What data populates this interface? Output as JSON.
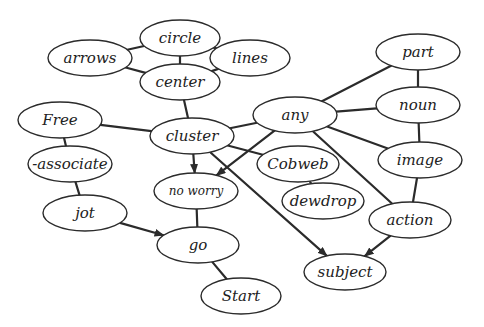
{
  "diagram": {
    "type": "mind-map",
    "colors": {
      "stroke": "#2b2b2b",
      "fill": "#ffffff",
      "text": "#222222"
    },
    "nodes": [
      {
        "id": "circle",
        "label": "circle",
        "x": 180,
        "y": 38,
        "rx": 40,
        "ry": 18
      },
      {
        "id": "arrows",
        "label": "arrows",
        "x": 90,
        "y": 58,
        "rx": 42,
        "ry": 18
      },
      {
        "id": "lines",
        "label": "lines",
        "x": 250,
        "y": 58,
        "rx": 40,
        "ry": 18
      },
      {
        "id": "center",
        "label": "center",
        "x": 180,
        "y": 82,
        "rx": 40,
        "ry": 18
      },
      {
        "id": "part",
        "label": "part",
        "x": 418,
        "y": 52,
        "rx": 42,
        "ry": 18
      },
      {
        "id": "any",
        "label": "any",
        "x": 295,
        "y": 115,
        "rx": 42,
        "ry": 18
      },
      {
        "id": "noun",
        "label": "noun",
        "x": 418,
        "y": 105,
        "rx": 42,
        "ry": 18
      },
      {
        "id": "free",
        "label": "Free",
        "x": 60,
        "y": 120,
        "rx": 42,
        "ry": 18
      },
      {
        "id": "cluster",
        "label": "cluster",
        "x": 192,
        "y": 136,
        "rx": 42,
        "ry": 18
      },
      {
        "id": "image",
        "label": "image",
        "x": 420,
        "y": 160,
        "rx": 42,
        "ry": 18
      },
      {
        "id": "cobweb",
        "label": "Cobweb",
        "x": 298,
        "y": 164,
        "rx": 41,
        "ry": 18
      },
      {
        "id": "associate",
        "label": "-associate",
        "x": 70,
        "y": 164,
        "rx": 42,
        "ry": 18
      },
      {
        "id": "noworry",
        "label": "no worry",
        "x": 196,
        "y": 191,
        "rx": 42,
        "ry": 18,
        "small": true
      },
      {
        "id": "dewdrop",
        "label": "dewdrop",
        "x": 323,
        "y": 201,
        "rx": 41,
        "ry": 18
      },
      {
        "id": "action",
        "label": "action",
        "x": 410,
        "y": 220,
        "rx": 41,
        "ry": 18
      },
      {
        "id": "jot",
        "label": "jot",
        "x": 85,
        "y": 213,
        "rx": 42,
        "ry": 18
      },
      {
        "id": "go",
        "label": "go",
        "x": 198,
        "y": 245,
        "rx": 41,
        "ry": 18
      },
      {
        "id": "subject",
        "label": "subject",
        "x": 345,
        "y": 272,
        "rx": 41,
        "ry": 18
      },
      {
        "id": "start",
        "label": "Start",
        "x": 241,
        "y": 296,
        "rx": 40,
        "ry": 18
      }
    ],
    "edges": [
      {
        "from": "circle",
        "to": "arrows",
        "arrow": false
      },
      {
        "from": "circle",
        "to": "lines",
        "arrow": false
      },
      {
        "from": "circle",
        "to": "center",
        "arrow": false
      },
      {
        "from": "arrows",
        "to": "center",
        "arrow": false
      },
      {
        "from": "lines",
        "to": "center",
        "arrow": false
      },
      {
        "from": "center",
        "to": "cluster",
        "arrow": false
      },
      {
        "from": "free",
        "to": "cluster",
        "arrow": false
      },
      {
        "from": "free",
        "to": "associate",
        "arrow": false
      },
      {
        "from": "associate",
        "to": "jot",
        "arrow": false
      },
      {
        "from": "jot",
        "to": "go",
        "arrow": true
      },
      {
        "from": "cluster",
        "to": "any",
        "arrow": false
      },
      {
        "from": "cluster",
        "to": "cobweb",
        "arrow": false
      },
      {
        "from": "cluster",
        "to": "noworry",
        "arrow": true
      },
      {
        "from": "cluster",
        "to": "subject",
        "arrow": true
      },
      {
        "from": "any",
        "to": "noworry",
        "arrow": true
      },
      {
        "from": "any",
        "to": "part",
        "arrow": false
      },
      {
        "from": "any",
        "to": "noun",
        "arrow": false
      },
      {
        "from": "any",
        "to": "image",
        "arrow": false
      },
      {
        "from": "any",
        "to": "action",
        "arrow": false
      },
      {
        "from": "part",
        "to": "noun",
        "arrow": false
      },
      {
        "from": "noun",
        "to": "image",
        "arrow": false
      },
      {
        "from": "image",
        "to": "action",
        "arrow": false
      },
      {
        "from": "action",
        "to": "subject",
        "arrow": true
      },
      {
        "from": "cobweb",
        "to": "dewdrop",
        "arrow": false
      },
      {
        "from": "noworry",
        "to": "go",
        "arrow": false
      },
      {
        "from": "go",
        "to": "start",
        "arrow": false
      }
    ]
  }
}
